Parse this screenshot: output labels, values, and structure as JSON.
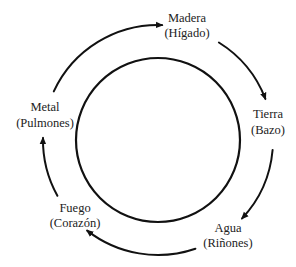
{
  "diagram": {
    "type": "cycle",
    "center": [
      158,
      140
    ],
    "inner_circle_radius": 82,
    "arrow_ring_radius": 115,
    "colors": {
      "stroke": "#111111",
      "text": "#222222",
      "background": "#ffffff"
    },
    "nodes": [
      {
        "id": "madera",
        "element": "Madera",
        "organ": "(Hígado)",
        "x": 187,
        "y1": 22,
        "y2": 37
      },
      {
        "id": "tierra",
        "element": "Tierra",
        "organ": "(Bazo)",
        "x": 268,
        "y1": 118,
        "y2": 134
      },
      {
        "id": "agua",
        "element": "Agua",
        "organ": "(Riñones)",
        "x": 228,
        "y1": 232,
        "y2": 247
      },
      {
        "id": "fuego",
        "element": "Fuego",
        "organ": "(Corazón)",
        "x": 75,
        "y1": 212,
        "y2": 227
      },
      {
        "id": "metal",
        "element": "Metal",
        "organ": "(Pulmones)",
        "x": 45,
        "y1": 111,
        "y2": 127
      }
    ],
    "arrows": [
      {
        "from": "metal",
        "to": "madera",
        "start_deg": 205,
        "end_deg": 272
      },
      {
        "from": "madera",
        "to": "tierra",
        "start_deg": 302,
        "end_deg": 339
      },
      {
        "from": "tierra",
        "to": "agua",
        "start_deg": 5,
        "end_deg": 43
      },
      {
        "from": "agua",
        "to": "fuego",
        "start_deg": 71,
        "end_deg": 128
      },
      {
        "from": "fuego",
        "to": "metal",
        "start_deg": 151,
        "end_deg": 181
      }
    ]
  }
}
